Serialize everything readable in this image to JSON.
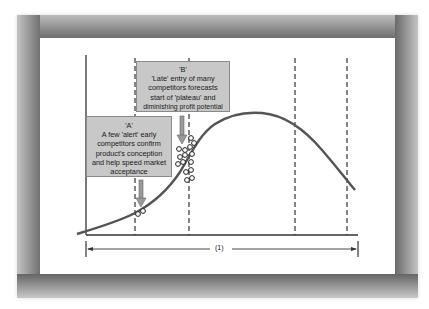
{
  "diagram": {
    "type": "product-life-cycle",
    "callouts": {
      "A": {
        "title": "'A'",
        "lines": [
          "A few 'alert' early",
          "competitors confirm",
          "product's conception",
          "and help speed market",
          "acceptance"
        ]
      },
      "B": {
        "title": "'B'",
        "lines": [
          "'Late' entry of many",
          "competitors forecasts",
          "start of 'plateau' and",
          "diminishing profit potential"
        ]
      }
    },
    "dimension_label": "(1)",
    "colors": {
      "callout_fill": "#c8c8c8",
      "curve": "#555555",
      "frame_shadow": "#7a7a7a",
      "panel": "#ffffff"
    },
    "curve_points": [
      [
        77,
        234
      ],
      [
        86,
        231
      ],
      [
        110,
        224
      ],
      [
        135,
        213
      ],
      [
        160,
        197
      ],
      [
        175,
        180
      ],
      [
        189,
        153
      ],
      [
        200,
        135
      ],
      [
        225,
        118
      ],
      [
        257,
        113
      ],
      [
        295,
        125
      ],
      [
        330,
        158
      ],
      [
        347,
        178
      ],
      [
        355,
        190
      ]
    ],
    "dashed_lines_x": [
      135,
      189,
      295,
      347
    ]
  }
}
